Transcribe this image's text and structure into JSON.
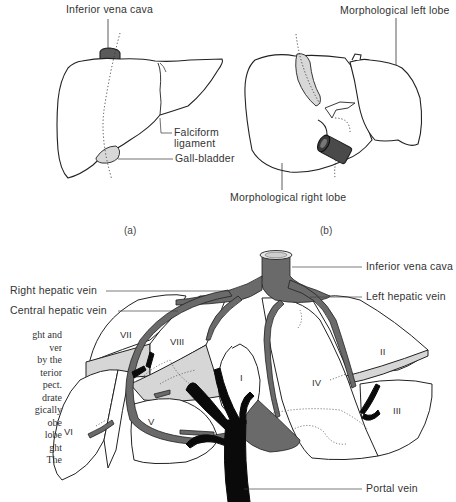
{
  "figure_a": {
    "labels": {
      "ivc": "Inferior vena cava",
      "falciform_line1": "Falciform",
      "falciform_line2": "ligament",
      "gallbladder": "Gall-bladder"
    },
    "caption": "(a)"
  },
  "figure_b": {
    "labels": {
      "left_lobe": "Morphological left lobe",
      "right_lobe": "Morphological right lobe"
    },
    "caption": "(b)"
  },
  "figure_c": {
    "labels": {
      "ivc": "Inferior vena cava",
      "right_hepatic_vein": "Right hepatic vein",
      "central_hepatic_vein": "Central hepatic vein",
      "left_hepatic_vein": "Left hepatic vein",
      "portal_vein": "Portal vein"
    },
    "segments": [
      "I",
      "II",
      "III",
      "IV",
      "V",
      "VI",
      "VII",
      "VIII"
    ]
  },
  "side_text": {
    "lines": [
      "ght and",
      "ver",
      "by the",
      "terior",
      "pect.",
      "drate",
      "gically",
      "obe",
      "lobe",
      "ght",
      "The"
    ]
  },
  "colors": {
    "vein_gray": "#6a6a6a",
    "portal_black": "#0a0a0a",
    "shade_light": "#d6d6d6",
    "outline": "#222222"
  }
}
